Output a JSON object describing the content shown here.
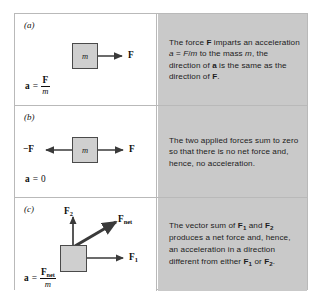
{
  "figure": {
    "panels": [
      {
        "letter": "(a)",
        "mass_label": "m",
        "force_labels": {
          "right": "F"
        },
        "formula": {
          "lhs": "a",
          "eq": "=",
          "numerator": "F",
          "denominator": "m"
        },
        "caption_parts": [
          "The force ",
          "F",
          " imparts an acceleration ",
          "a",
          " = ",
          "F",
          "/",
          "m",
          " to the mass ",
          "m",
          ", the direction of ",
          "a",
          " is the same as the direction of ",
          "F",
          "."
        ],
        "caption_plain": "The force F imparts an acceleration a = F/m to the mass m, the direction of a is the same as the direction of F."
      },
      {
        "letter": "(b)",
        "mass_label": "m",
        "force_labels": {
          "left": "−F",
          "right": "F"
        },
        "formula": {
          "lhs": "a",
          "eq": "=",
          "value": "0"
        },
        "caption_plain": "The two applied forces sum to zero so that there is no net force and, hence, no acceleration."
      },
      {
        "letter": "(c)",
        "mass_label": "",
        "force_labels": {
          "up": "F",
          "up_sub": "2",
          "right": "F",
          "right_sub": "1",
          "diagonal": "F",
          "diagonal_sub": "net"
        },
        "formula": {
          "lhs": "a",
          "eq": "=",
          "numerator": "F",
          "numerator_sub": "net",
          "denominator": "m"
        },
        "caption_plain": "The vector sum of F1 and F2 produces a net force and, hence, an acceleration in a direction different from either F1 or F2."
      }
    ]
  },
  "colors": {
    "caption_background": "#c9c9c9",
    "mass_block_fill": "#cfcfcf",
    "mass_block_stroke": "#4a4a4a",
    "arrow": "#3a3a3a",
    "frame_border": "#b9b9b9",
    "page_background": "#ffffff"
  }
}
